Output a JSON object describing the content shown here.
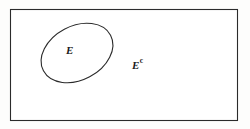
{
  "diagram": {
    "type": "venn-diagram",
    "background_color": "#fdfdfc",
    "stroke_color": "#2b2b2b",
    "fill_color": "#ffffff",
    "universe": {
      "shape": "rectangle",
      "name": "universal-set-rectangle",
      "x": 10,
      "y": 9,
      "width": 228,
      "height": 112,
      "stroke_width": 1.1
    },
    "set": {
      "shape": "ellipse",
      "name": "set-e-ellipse",
      "center_x": 77,
      "center_y": 53,
      "radius_x": 38,
      "radius_y": 27,
      "rotation_deg": -28,
      "stroke_width": 1.1
    },
    "labels": {
      "set_label": "E",
      "complement_base": "E",
      "complement_superscript": "c"
    }
  }
}
